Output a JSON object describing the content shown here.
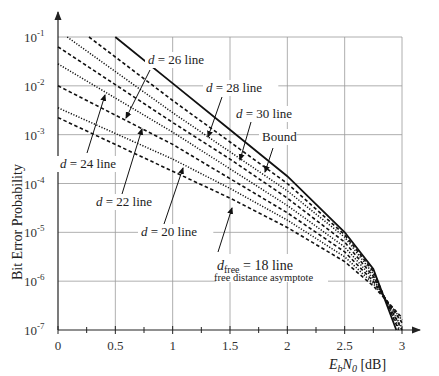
{
  "chart_data": {
    "type": "line",
    "title": "",
    "xlabel": "E_b/N_0 [dB]",
    "ylabel": "Bit Error Probability",
    "xlim": [
      0,
      3
    ],
    "ylim": [
      1e-07,
      0.1
    ],
    "yscale": "log",
    "grid": true,
    "x_ticks": [
      "0",
      "0.5",
      "1",
      "1.5",
      "2",
      "2.5",
      "3"
    ],
    "x_tick_values": [
      0,
      0.5,
      1,
      1.5,
      2,
      2.5,
      3
    ],
    "y_ticks_exp": [
      -1,
      -2,
      -3,
      -4,
      -5,
      -6,
      -7
    ],
    "series": [
      {
        "name": "Bound",
        "style": "solid",
        "x": [
          0.5,
          1,
          1.5,
          2,
          2.5,
          2.75,
          2.95
        ],
        "log10_y": [
          -1,
          -1.95,
          -2.9,
          -3.85,
          -5.0,
          -5.75,
          -7
        ]
      },
      {
        "name": "d = 30 line",
        "style": "dashed",
        "x": [
          0.27,
          1,
          1.5,
          2,
          2.5,
          2.75,
          2.97
        ],
        "log10_y": [
          -1,
          -2.3,
          -3.15,
          -4.0,
          -5.05,
          -5.8,
          -7
        ]
      },
      {
        "name": "d = 28 line",
        "style": "dotted",
        "x": [
          0.08,
          1,
          1.5,
          2,
          2.5,
          2.75,
          2.98
        ],
        "log10_y": [
          -1,
          -2.55,
          -3.35,
          -4.15,
          -5.1,
          -5.85,
          -7
        ]
      },
      {
        "name": "d = 26 line",
        "style": "dashed",
        "x": [
          0,
          1,
          1.5,
          2,
          2.5,
          2.75,
          3.0
        ],
        "log10_y": [
          -1.2,
          -2.75,
          -3.5,
          -4.3,
          -5.2,
          -5.9,
          -7
        ]
      },
      {
        "name": "d = 24 line",
        "style": "dotted",
        "x": [
          0,
          1,
          1.5,
          2,
          2.5,
          2.75,
          3.0
        ],
        "log10_y": [
          -1.55,
          -2.95,
          -3.7,
          -4.45,
          -5.3,
          -5.95,
          -6.95
        ]
      },
      {
        "name": "d = 22 line",
        "style": "dashed",
        "x": [
          0,
          1,
          1.5,
          2,
          2.5,
          2.75,
          3.0
        ],
        "log10_y": [
          -2.0,
          -3.2,
          -3.9,
          -4.6,
          -5.4,
          -6.0,
          -6.85
        ]
      },
      {
        "name": "d = 20 line",
        "style": "dotted",
        "x": [
          0,
          1,
          1.5,
          2,
          2.5,
          2.75,
          3.0
        ],
        "log10_y": [
          -2.45,
          -3.5,
          -4.1,
          -4.75,
          -5.5,
          -6.05,
          -6.8
        ]
      },
      {
        "name": "d_free = 18 line",
        "style": "dashed",
        "x": [
          0,
          1,
          1.5,
          2,
          2.5,
          2.75,
          3.0
        ],
        "log10_y": [
          -2.65,
          -3.75,
          -4.3,
          -4.9,
          -5.6,
          -6.1,
          -6.75
        ]
      }
    ],
    "annotations": [
      {
        "text": "d = 26 line",
        "text_x": 148,
        "text_y": 64,
        "arrow_from": [
          150,
          70
        ],
        "arrow_to": [
          126,
          118
        ]
      },
      {
        "text": "d = 28 line",
        "text_x": 206,
        "text_y": 92,
        "arrow_from": [
          222,
          97
        ],
        "arrow_to": [
          208,
          137
        ]
      },
      {
        "text": "d = 30 line",
        "text_x": 236,
        "text_y": 118,
        "arrow_from": [
          251,
          122
        ],
        "arrow_to": [
          240,
          160
        ]
      },
      {
        "text": "Bound",
        "text_x": 262,
        "text_y": 141,
        "arrow_from": [
          273,
          148
        ],
        "arrow_to": [
          265,
          172
        ]
      },
      {
        "text": "d = 24 line",
        "text_x": 60,
        "text_y": 168,
        "arrow_from": [
          87,
          153
        ],
        "arrow_to": [
          105,
          95
        ]
      },
      {
        "text": "d = 22 line",
        "text_x": 96,
        "text_y": 206,
        "arrow_from": [
          122,
          194
        ],
        "arrow_to": [
          142,
          129
        ]
      },
      {
        "text": "d = 20 line",
        "text_x": 141,
        "text_y": 236,
        "arrow_from": [
          164,
          224
        ],
        "arrow_to": [
          183,
          168
        ]
      },
      {
        "text": "free distance asymptote",
        "text_x": 215,
        "text_y": 278
      }
    ]
  },
  "labels": {
    "ylabel": "Bit Error Probability",
    "x_axis_E": "E",
    "x_axis_b": "b",
    "x_axis_N": "N",
    "x_axis_0": "0",
    "x_axis_unit": " [dB]",
    "y_tick_base": "10",
    "dfree_d": "d",
    "dfree_sub": "free",
    "dfree_rest": " = 18 line",
    "dfree_note": "free distance asymptote"
  }
}
